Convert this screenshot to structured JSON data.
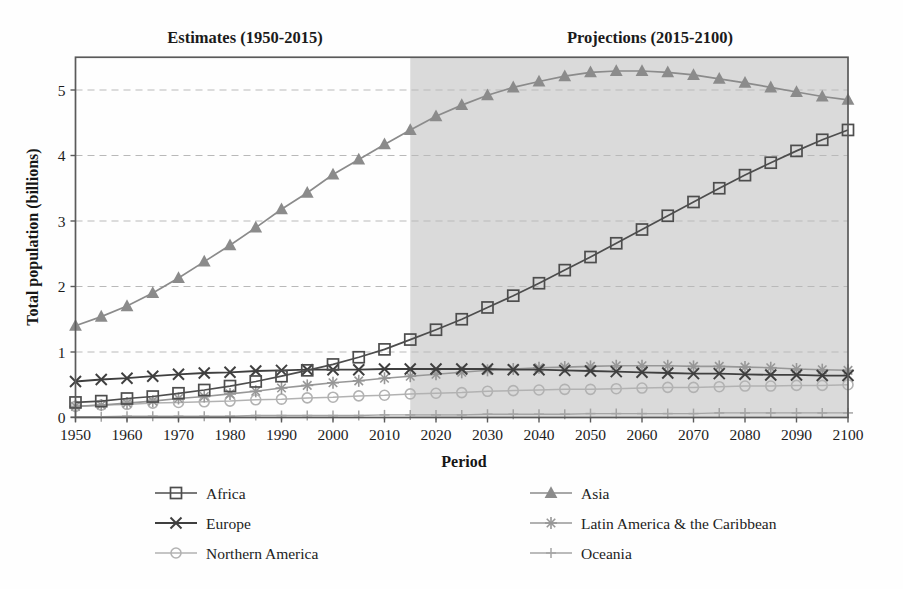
{
  "chart_data": {
    "type": "line",
    "title_left": "Estimates (1950-2015)",
    "title_right": "Projections (2015-2100)",
    "xlabel": "Period",
    "ylabel": "Total population (billions)",
    "xlim": [
      1950,
      2100
    ],
    "ylim": [
      0,
      5.5
    ],
    "x_step_years": 5,
    "x": [
      1950,
      1955,
      1960,
      1965,
      1970,
      1975,
      1980,
      1985,
      1990,
      1995,
      2000,
      2005,
      2010,
      2015,
      2020,
      2025,
      2030,
      2035,
      2040,
      2045,
      2050,
      2055,
      2060,
      2065,
      2070,
      2075,
      2080,
      2085,
      2090,
      2095,
      2100
    ],
    "x_tick_labels": [
      "1950",
      "1960",
      "1970",
      "1980",
      "1990",
      "2000",
      "2010",
      "2020",
      "2030",
      "2040",
      "2050",
      "2060",
      "2070",
      "2080",
      "2090",
      "2100"
    ],
    "y_ticks": [
      "0",
      "1",
      "2",
      "3",
      "4",
      "5"
    ],
    "grid": "horizontal dashed lines at integer values",
    "shaded_region": {
      "from": 2015,
      "to": 2100,
      "color": "#dadada",
      "meaning": "projection period"
    },
    "series": [
      {
        "name": "Africa",
        "marker": "square-open",
        "color": "#4d4d4d",
        "line_width": 1.7,
        "values": [
          0.23,
          0.25,
          0.29,
          0.32,
          0.37,
          0.42,
          0.48,
          0.55,
          0.63,
          0.72,
          0.81,
          0.92,
          1.04,
          1.19,
          1.34,
          1.5,
          1.68,
          1.86,
          2.05,
          2.25,
          2.45,
          2.66,
          2.87,
          3.08,
          3.29,
          3.5,
          3.7,
          3.89,
          4.07,
          4.24,
          4.39
        ]
      },
      {
        "name": "Asia",
        "marker": "triangle-filled",
        "color": "#8b8b8b",
        "line_width": 1.7,
        "values": [
          1.4,
          1.54,
          1.7,
          1.9,
          2.13,
          2.38,
          2.63,
          2.9,
          3.18,
          3.43,
          3.71,
          3.94,
          4.17,
          4.39,
          4.6,
          4.77,
          4.92,
          5.04,
          5.13,
          5.21,
          5.27,
          5.29,
          5.29,
          5.27,
          5.23,
          5.17,
          5.11,
          5.04,
          4.97,
          4.9,
          4.85
        ]
      },
      {
        "name": "Europe",
        "marker": "x",
        "color": "#3f3f3f",
        "line_width": 1.8,
        "values": [
          0.55,
          0.58,
          0.6,
          0.63,
          0.66,
          0.68,
          0.69,
          0.71,
          0.72,
          0.73,
          0.73,
          0.73,
          0.74,
          0.74,
          0.74,
          0.74,
          0.74,
          0.73,
          0.73,
          0.72,
          0.71,
          0.7,
          0.69,
          0.68,
          0.67,
          0.67,
          0.66,
          0.65,
          0.65,
          0.64,
          0.64
        ]
      },
      {
        "name": "Latin America & the Caribbean",
        "marker": "asterisk",
        "color": "#979797",
        "line_width": 1.6,
        "values": [
          0.17,
          0.19,
          0.22,
          0.25,
          0.29,
          0.32,
          0.36,
          0.4,
          0.45,
          0.49,
          0.53,
          0.56,
          0.6,
          0.63,
          0.66,
          0.69,
          0.72,
          0.74,
          0.76,
          0.77,
          0.78,
          0.79,
          0.79,
          0.79,
          0.78,
          0.78,
          0.77,
          0.76,
          0.74,
          0.73,
          0.72
        ]
      },
      {
        "name": "Northern America",
        "marker": "circle-open",
        "color": "#b2b2b2",
        "line_width": 1.5,
        "values": [
          0.17,
          0.19,
          0.2,
          0.22,
          0.23,
          0.24,
          0.25,
          0.27,
          0.28,
          0.3,
          0.31,
          0.33,
          0.34,
          0.36,
          0.37,
          0.38,
          0.4,
          0.41,
          0.42,
          0.43,
          0.43,
          0.44,
          0.45,
          0.46,
          0.46,
          0.47,
          0.48,
          0.48,
          0.49,
          0.49,
          0.5
        ]
      },
      {
        "name": "Oceania",
        "marker": "plus",
        "color": "#a4a4a4",
        "line_width": 1.4,
        "values": [
          0.01,
          0.01,
          0.02,
          0.02,
          0.02,
          0.02,
          0.02,
          0.03,
          0.03,
          0.03,
          0.03,
          0.03,
          0.04,
          0.04,
          0.04,
          0.04,
          0.05,
          0.05,
          0.05,
          0.05,
          0.06,
          0.06,
          0.06,
          0.06,
          0.06,
          0.07,
          0.07,
          0.07,
          0.07,
          0.07,
          0.07
        ]
      }
    ],
    "legend_position": "below chart, two columns",
    "legend_columns": [
      [
        "Africa",
        "Europe",
        "Northern America"
      ],
      [
        "Asia",
        "Latin America & the Caribbean",
        "Oceania"
      ]
    ],
    "colors": {
      "grid": "#b9b9b9",
      "border": "#5a5a5a",
      "shade": "#dadada",
      "text": "#1b1b1b"
    }
  }
}
